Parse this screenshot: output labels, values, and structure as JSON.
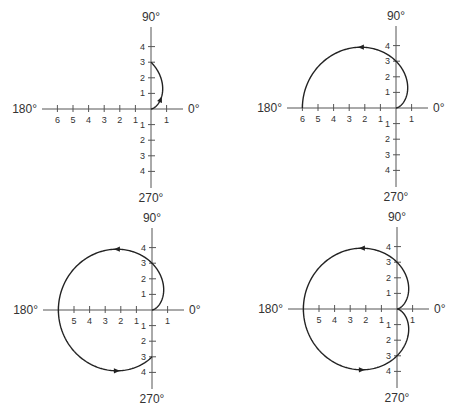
{
  "chart_data": [
    {
      "type": "line",
      "subtype": "polar",
      "equation": "r = 3(1 - cos θ)",
      "theta_range_deg": [
        0,
        90
      ],
      "arrows_at_deg": [
        45
      ],
      "angle_labels": {
        "right": "0°",
        "top": "90°",
        "left": "180°",
        "bottom": "270°"
      },
      "neg_x_ticks": [
        "6",
        "5",
        "4",
        "3",
        "2",
        "1"
      ],
      "pos_x_ticks": [
        "1"
      ],
      "pos_y_ticks": [
        "1",
        "2",
        "3",
        "4"
      ],
      "neg_y_ticks": [
        "1",
        "2",
        "3",
        "4"
      ],
      "origin": [
        151,
        109
      ],
      "scale": 15.6
    },
    {
      "type": "line",
      "subtype": "polar",
      "equation": "r = 3(1 - cos θ)",
      "theta_range_deg": [
        0,
        180
      ],
      "arrows_at_deg": [
        120
      ],
      "angle_labels": {
        "right": "0°",
        "top": "90°",
        "left": "180°",
        "bottom": "270°"
      },
      "neg_x_ticks": [
        "6",
        "5",
        "4",
        "3",
        "2",
        "1"
      ],
      "pos_x_ticks": [
        "1"
      ],
      "pos_y_ticks": [
        "1",
        "2",
        "3",
        "4"
      ],
      "neg_y_ticks": [
        "1",
        "2",
        "3",
        "4"
      ],
      "origin": [
        396,
        108
      ],
      "scale": 15.6
    },
    {
      "type": "line",
      "subtype": "polar",
      "equation": "r = 3(1 - cos θ)",
      "theta_range_deg": [
        0,
        270
      ],
      "arrows_at_deg": [
        120,
        240
      ],
      "angle_labels": {
        "right": "0°",
        "top": "90°",
        "left": "180°",
        "bottom": "270°"
      },
      "neg_x_ticks": [
        "",
        "5",
        "4",
        "3",
        "2",
        "1"
      ],
      "pos_x_ticks": [
        "1"
      ],
      "pos_y_ticks": [
        "1",
        "2",
        "3",
        "4"
      ],
      "neg_y_ticks": [
        "1",
        "2",
        "3",
        "4"
      ],
      "origin": [
        152,
        310
      ],
      "scale": 15.6
    },
    {
      "type": "line",
      "subtype": "polar",
      "equation": "r = 3(1 - cos θ)",
      "theta_range_deg": [
        0,
        360
      ],
      "arrows_at_deg": [
        120,
        240
      ],
      "angle_labels": {
        "right": "0°",
        "top": "90°",
        "left": "180°",
        "bottom": "270°"
      },
      "neg_x_ticks": [
        "",
        "5",
        "4",
        "3",
        "2",
        "1"
      ],
      "pos_x_ticks": [
        "1"
      ],
      "pos_y_ticks": [
        "1",
        "2",
        "3",
        "4"
      ],
      "neg_y_ticks": [
        "1",
        "2",
        "3",
        "4"
      ],
      "origin": [
        397,
        309
      ],
      "scale": 15.6
    }
  ]
}
